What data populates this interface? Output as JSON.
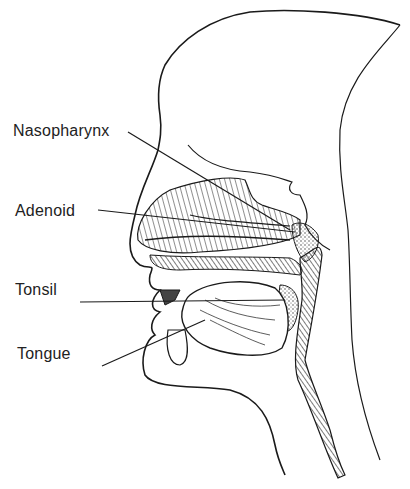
{
  "diagram": {
    "type": "anatomical cross-section of head and throat",
    "labels": [
      {
        "id": "nasopharynx",
        "text": "Nasopharynx",
        "x": 13,
        "y": 122
      },
      {
        "id": "adenoid",
        "text": "Adenoid",
        "x": 15,
        "y": 202
      },
      {
        "id": "tonsil",
        "text": "Tonsil",
        "x": 15,
        "y": 281
      },
      {
        "id": "tongue",
        "text": "Tongue",
        "x": 17,
        "y": 345
      }
    ],
    "colors": {
      "line": "#1a1a1a",
      "label": "#222222",
      "background": "#ffffff"
    }
  }
}
